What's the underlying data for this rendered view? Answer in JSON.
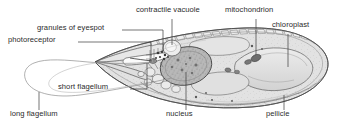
{
  "figure": {
    "style": "pencil-shaded biological line drawing, greyscale",
    "background_color": "#ffffff",
    "line_color": "#4a4a4a",
    "text_color": "#2b2b2b",
    "canvas": {
      "width": 338,
      "height": 131
    }
  },
  "labels": [
    {
      "id": "contractile-vacuole",
      "text": "contractile vacuole",
      "x": 136,
      "y": 9,
      "anchor": "start",
      "leader": {
        "type": "vertical",
        "from_x": 172,
        "from_y": 19,
        "to_x": 172,
        "to_y": 57
      }
    },
    {
      "id": "mitochondrion",
      "text": "mitochondrion",
      "x": 225,
      "y": 9,
      "anchor": "start",
      "leader": {
        "type": "vertical",
        "from_x": 256,
        "from_y": 19,
        "to_x": 256,
        "to_y": 55
      }
    },
    {
      "id": "chloroplast",
      "text": "chloroplast",
      "x": 272,
      "y": 25,
      "anchor": "start",
      "leader": {
        "type": "vertical",
        "from_x": 288,
        "from_y": 34,
        "to_x": 288,
        "to_y": 67
      }
    },
    {
      "id": "granules-of-eyespot",
      "text": "granules of eyespot",
      "x": 37,
      "y": 27,
      "anchor": "start",
      "leader": {
        "type": "elbow",
        "from_x": 122,
        "from_y": 30,
        "to_x": 162,
        "to_y": 30,
        "drop_y": 56
      }
    },
    {
      "id": "photoreceptor",
      "text": "photoreceptor",
      "x": 14,
      "y": 39,
      "anchor": "start",
      "leader": {
        "type": "elbow",
        "from_x": 78,
        "from_y": 42,
        "to_x": 152,
        "to_y": 42,
        "drop_y": 57
      }
    },
    {
      "id": "short-flagellum",
      "text": "short flagellum",
      "x": 58,
      "y": 86,
      "anchor": "start",
      "leader": {
        "type": "elbow",
        "from_x": 130,
        "from_y": 89,
        "to_x": 147,
        "to_y": 89,
        "drop_y": 61
      }
    },
    {
      "id": "long-flagellum",
      "text": "long flagellum",
      "x": 14,
      "y": 113,
      "anchor": "start",
      "leader": {
        "type": "vertical",
        "from_x": 39,
        "from_y": 110,
        "to_x": 39,
        "to_y": 93
      }
    },
    {
      "id": "nucleus",
      "text": "nucleus",
      "x": 168,
      "y": 113,
      "anchor": "start",
      "leader": {
        "type": "vertical",
        "from_x": 186,
        "from_y": 110,
        "to_x": 186,
        "to_y": 70
      }
    },
    {
      "id": "pellicle",
      "text": "pellicle",
      "x": 268,
      "y": 113,
      "anchor": "start",
      "leader": {
        "type": "vertical",
        "from_x": 284,
        "from_y": 110,
        "to_x": 284,
        "to_y": 96
      }
    }
  ],
  "structures": [
    {
      "id": "cell-body",
      "name": "Euglena cell body",
      "description": "elongated spindle, pointed anterior beak at left, rounded posterior at right"
    },
    {
      "id": "pellicle",
      "name": "pellicle",
      "description": "striated outer envelope of small rectangular blocks around the whole cell"
    },
    {
      "id": "nucleus",
      "name": "nucleus",
      "description": "large stippled oval in the mid-left of the cell"
    },
    {
      "id": "chloroplast",
      "name": "chloroplast",
      "description": "large pale lobed body in the right half of the cell"
    },
    {
      "id": "mitochondrion",
      "name": "mitochondrion",
      "description": "small dark elongated organelle upper-centre-right"
    },
    {
      "id": "contractile-vacuole",
      "name": "contractile vacuole",
      "description": "rounded pale vesicle near the anterior reservoir"
    },
    {
      "id": "eyespot-granules",
      "name": "granules of eyespot",
      "description": "cluster of dark dots beside the reservoir"
    },
    {
      "id": "photoreceptor",
      "name": "photoreceptor",
      "description": "small swelling at the base of the flagella"
    },
    {
      "id": "short-flagellum",
      "name": "short flagellum",
      "description": "stub flagellum inside the anterior reservoir"
    },
    {
      "id": "long-flagellum",
      "name": "long flagellum",
      "description": "long thin filament looping far to the left of the cell"
    },
    {
      "id": "vesicles",
      "name": "cytoplasmic vesicles",
      "description": "chain of pale rounded granules along the lower cytoplasm"
    }
  ]
}
